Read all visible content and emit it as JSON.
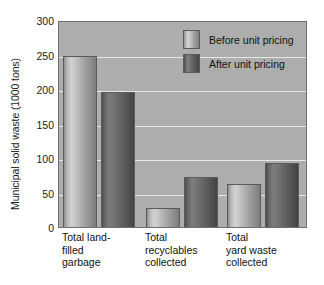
{
  "chart_data": {
    "type": "bar",
    "title": "",
    "xlabel": "",
    "ylabel": "Municipal solid waste (1000 tons)",
    "ylim": [
      0,
      300
    ],
    "yticks": [
      0,
      50,
      100,
      150,
      200,
      250,
      300
    ],
    "ytick_labels": [
      "0",
      "50",
      "100",
      "150",
      "200",
      "250",
      "300"
    ],
    "grid": true,
    "grid_axis": "y",
    "legend_position": "upper right",
    "categories": [
      "Total land-filled garbage",
      "Total recyclables collected",
      "Total yard waste collected"
    ],
    "category_label_lines": [
      [
        "Total land-",
        "filled",
        "garbage"
      ],
      [
        "Total",
        "recyclables",
        "collected"
      ],
      [
        "Total",
        "yard waste",
        "collected"
      ]
    ],
    "series": [
      {
        "name": "Before unit pricing",
        "color": "#bdbdbd",
        "values": [
          248,
          28,
          63
        ]
      },
      {
        "name": "After unit pricing",
        "color": "#6a6a6a",
        "values": [
          196,
          72,
          93
        ]
      }
    ]
  },
  "axis": {
    "y_title": "Municipal solid waste (1000 tons)",
    "y_tick_labels": [
      "300",
      "250",
      "200",
      "150",
      "100",
      "50",
      "0"
    ]
  },
  "legend": {
    "items": [
      {
        "label": "Before unit pricing",
        "key": "before"
      },
      {
        "label": "After unit pricing",
        "key": "after"
      }
    ]
  },
  "x_labels": [
    {
      "line1": "Total land-",
      "line2": "filled",
      "line3": "garbage"
    },
    {
      "line1": "Total",
      "line2": "recyclables",
      "line3": "collected"
    },
    {
      "line1": "Total",
      "line2": "yard waste",
      "line3": "collected"
    }
  ],
  "colors": {
    "plot_background": "#adadad",
    "gridline": "#e8e8e8",
    "axis_border": "#6f6f6f",
    "bar_before": "#bdbdbd",
    "bar_after": "#6a6a6a",
    "text": "#111111"
  }
}
